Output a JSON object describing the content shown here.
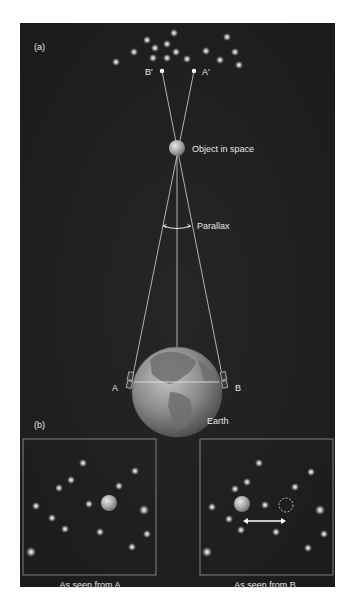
{
  "colors": {
    "page_background": "#ffffff",
    "frame_background": "#1f1f1f",
    "line": "#d8d8d8",
    "text": "#e6e6e6",
    "star": "#f2f2f2",
    "object_sphere": "#b8b8b8",
    "earth": "#8a8a8a"
  },
  "panel_a": {
    "label": "(a)",
    "point_b_prime_label": "B′",
    "point_a_prime_label": "A′",
    "object_label": "Object in space",
    "parallax_label": "Parallax",
    "observer_a_label": "A",
    "observer_b_label": "B",
    "earth_label": "Earth"
  },
  "panel_b": {
    "label": "(b)",
    "view_from_a_caption": "As seen from A",
    "view_from_b_caption": "As seen from B"
  },
  "icons": {
    "object_sphere": "sphere-icon",
    "earth_globe": "globe-icon",
    "telescope_a": "telescope-icon",
    "telescope_b": "telescope-icon",
    "shift_arrow": "double-arrow-icon",
    "former_position_marker": "dashed-circle-icon"
  }
}
